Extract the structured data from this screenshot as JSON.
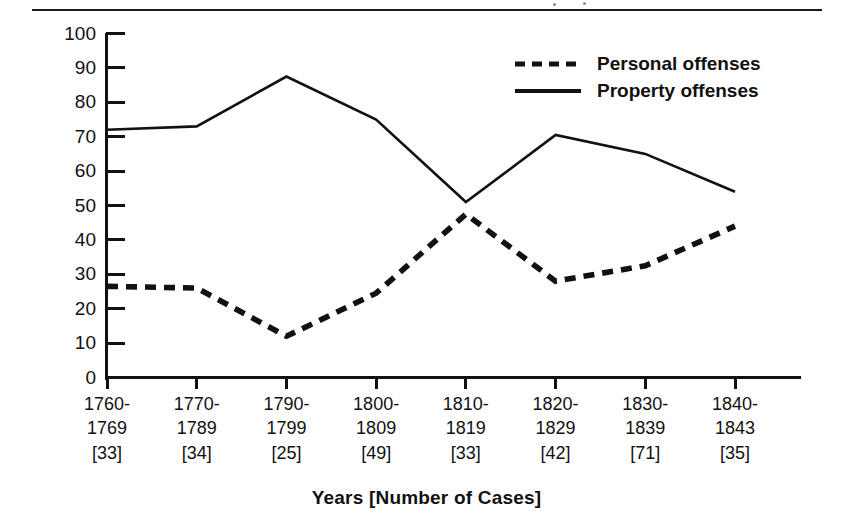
{
  "figure": {
    "caption_rule": true,
    "ink_color": "#111111"
  },
  "chart_data": {
    "type": "line",
    "title": "",
    "xlabel": "Years [Number of Cases]",
    "ylabel": "Percentage",
    "ylim": [
      0,
      100
    ],
    "ytick_step": 10,
    "yticks": [
      "100",
      "90",
      "80",
      "70",
      "60",
      "50",
      "40",
      "30",
      "20",
      "10",
      "0"
    ],
    "grid": false,
    "legend_position": "top-right",
    "categories": [
      "1760-1769 [33]",
      "1770-1789 [34]",
      "1790-1799 [25]",
      "1800-1809 [49]",
      "1810-1819 [33]",
      "1820-1829 [42]",
      "1830-1839 [71]",
      "1840-1843 [35]"
    ],
    "category_parts": [
      {
        "start": "1760-",
        "end": "1769",
        "cases": "[33]"
      },
      {
        "start": "1770-",
        "end": "1789",
        "cases": "[34]"
      },
      {
        "start": "1790-",
        "end": "1799",
        "cases": "[25]"
      },
      {
        "start": "1800-",
        "end": "1809",
        "cases": "[49]"
      },
      {
        "start": "1810-",
        "end": "1819",
        "cases": "[33]"
      },
      {
        "start": "1820-",
        "end": "1829",
        "cases": "[42]"
      },
      {
        "start": "1830-",
        "end": "1839",
        "cases": "[71]"
      },
      {
        "start": "1840-",
        "end": "1843",
        "cases": "[35]"
      }
    ],
    "series": [
      {
        "name": "Personal offenses",
        "style": "dashed",
        "values": [
          26.5,
          26,
          12,
          24.5,
          47.5,
          28,
          32.5,
          44
        ]
      },
      {
        "name": "Property offenses",
        "style": "solid",
        "values": [
          72,
          73,
          87.5,
          75,
          51,
          70.5,
          65,
          54
        ]
      }
    ]
  },
  "legend": {
    "items": [
      {
        "label": "Personal offenses",
        "style": "dashed"
      },
      {
        "label": "Property offenses",
        "style": "solid"
      }
    ]
  }
}
